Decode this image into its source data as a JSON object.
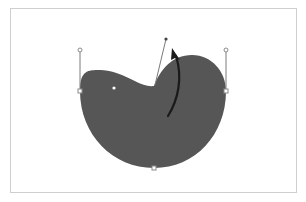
{
  "canvas": {
    "width": 306,
    "height": 202,
    "background": "#ffffff",
    "frame_border_color": "#cfcfcf"
  },
  "shape": {
    "fill": "#565656",
    "description": "blob shape being edited with bezier handles"
  },
  "handles": {
    "stroke": "#7a7a7a",
    "point_fill": "#ffffff",
    "point_stroke": "#8a8a8a",
    "active_point_fill": "#444444"
  },
  "arrow": {
    "color": "#1a1a1a",
    "description": "curved arrow indicating drag direction"
  }
}
